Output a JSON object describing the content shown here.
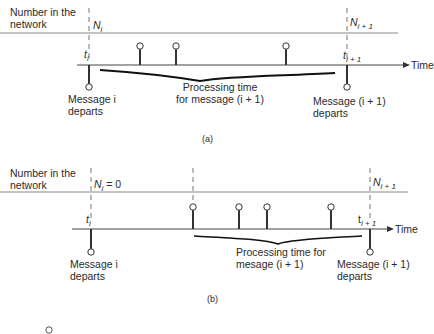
{
  "diagram_a": {
    "caption": "(a)",
    "row_label_line1": "Number in the",
    "row_label_line2": "network",
    "n_i": "N",
    "n_i_sub": "i",
    "n_i1": "N",
    "n_i1_sub": "i + 1",
    "t_i": "t",
    "t_i_sub": "i",
    "t_i1": "t",
    "t_i1_sub": "i + 1",
    "time_label": "Time",
    "brace_label_line1": "Processing time",
    "brace_label_line2": "for message (i + 1)",
    "depart_i_line1": "Message i",
    "depart_i_line2": "departs",
    "depart_i1_line1": "Message (i + 1)",
    "depart_i1_line2": "departs"
  },
  "diagram_b": {
    "caption": "(b)",
    "row_label_line1": "Number in the",
    "row_label_line2": "network",
    "n_i": "N",
    "n_i_sub": "i",
    "n_i_value": "= 0",
    "n_i1": "N",
    "n_i1_sub": "i + 1",
    "t_i": "t",
    "t_i_sub": "i",
    "t_i1": "t",
    "t_i1_sub": "i + 1",
    "time_label": "Time",
    "brace_label_line1": "Processing time for",
    "brace_label_line2": "mesage (i + 1)",
    "depart_i_line1": "Message i",
    "depart_i_line2": "departs",
    "depart_i1_line1": "Message (i + 1)",
    "depart_i1_line2": "departs"
  },
  "legend_symbol": "arrival-circle"
}
